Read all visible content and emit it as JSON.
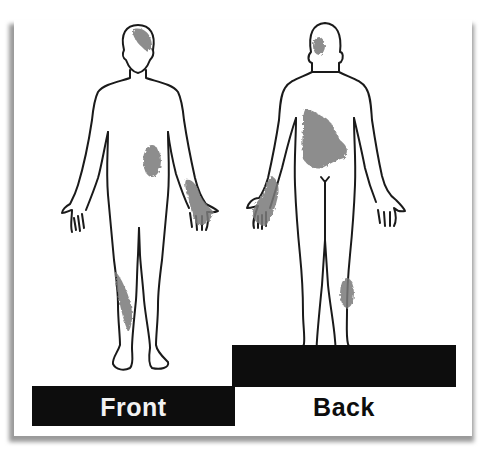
{
  "diagram": {
    "type": "body-map",
    "views": [
      {
        "id": "front",
        "label": "Front",
        "marked_regions": [
          "head-right-top",
          "right-abdomen",
          "left-forearm-hand",
          "right-lower-leg-shin"
        ]
      },
      {
        "id": "back",
        "label": "Back",
        "marked_regions": [
          "head-back-left",
          "upper-mid-back",
          "left-forearm-hand",
          "right-calf"
        ]
      }
    ],
    "colors": {
      "outline": "#1a1a1a",
      "shading": "#7a7a7a",
      "label_bar": "#0d0d0d",
      "front_label_text": "#f2f2f2",
      "back_label_text": "#0d0d0d",
      "background": "#ffffff"
    }
  }
}
